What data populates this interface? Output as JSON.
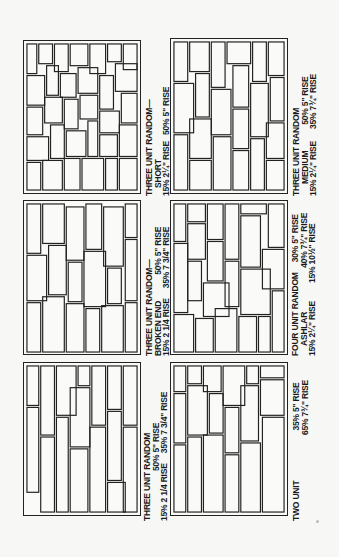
{
  "figure": {
    "panels": [
      {
        "id": "three-unit-random-short",
        "title": "THREE UNIT RANDOM—",
        "subtitle": "SHORT",
        "lines": [
          "15%  2¼\" RISE",
          "50% 5\" RISE",
          "35% 7¾\" RISE"
        ],
        "line1": "SHORT",
        "line2a": "15%  2¼\" RISE",
        "line2b": "50% 5\" RISE",
        "line3": "35% 7¾\" RISE"
      },
      {
        "id": "three-unit-random-medium",
        "title": "THREE UNIT RANDOM",
        "subtitle": "MEDIUM",
        "line1": "MEDIUM",
        "line2a": "15%  2¼\" RISE",
        "line2b": "50%  5\" RISE",
        "line3": "35%  7¾\" RISE"
      },
      {
        "id": "three-unit-random-broken-end",
        "title": "THREE UNIT RANDOM—",
        "subtitle": "BROKEN END",
        "line1": "BROKEN END",
        "line2a": "15%  2 1/4 RISE",
        "line2b": "50% 5\" RISE",
        "line3": "35% 7 3/4\" RISE"
      },
      {
        "id": "four-unit-random-ashlar",
        "title": "FOUR UNIT RANDOM",
        "subtitle": "ASHLAR",
        "line1": "ASHLAR",
        "line2a": "15%  2¼\" RISE",
        "line2b": "30% 5\" RISE",
        "line3": "40% 7¾\" RISE",
        "line4": "15% 10½\" RISE"
      },
      {
        "id": "three-unit-random",
        "title": "THREE UNIT RANDOM",
        "subtitle": "",
        "line1": "",
        "line2a": "15% 2 1/4 RISE",
        "line2b": "50% 5\" RISE",
        "line3": "35% 7 3/4\" RISE"
      },
      {
        "id": "two-unit",
        "title": "TWO UNIT",
        "subtitle": "",
        "line1": "",
        "line2a": "",
        "line2b": "35%  5\" RISE",
        "line3": "65%  7¾\" RISE"
      }
    ]
  }
}
